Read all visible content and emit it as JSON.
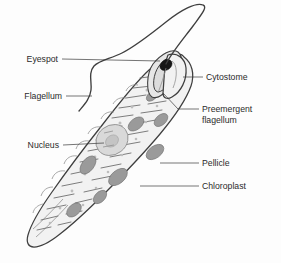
{
  "figure": {
    "background_color": "#fdfdfd",
    "outline_color": "#3f3f3f",
    "cell_fill_color": "#f2f2f2",
    "chloroplast_color": "#9a9a9a",
    "nucleus_color": "#d9d9d9",
    "eyespot_color": "#171717",
    "label_color": "#2b2b2b"
  },
  "labels": {
    "eyespot": "Eyespot",
    "flagellum": "Flagellum",
    "nucleus": "Nucleus",
    "cytostome": "Cytostome",
    "preemergent_line1": "Preemergent",
    "preemergent_line2": "flagellum",
    "pellicle": "Pellicle",
    "chloroplast": "Chloroplast"
  },
  "parts": [
    {
      "name": "eyespot",
      "label": "Eyespot",
      "side": "left"
    },
    {
      "name": "flagellum",
      "label": "Flagellum",
      "side": "left"
    },
    {
      "name": "nucleus",
      "label": "Nucleus",
      "side": "left"
    },
    {
      "name": "cytostome",
      "label": "Cytostome",
      "side": "right"
    },
    {
      "name": "preemergent-flagellum",
      "label": "Preemergent flagellum",
      "side": "right"
    },
    {
      "name": "pellicle",
      "label": "Pellicle",
      "side": "right"
    },
    {
      "name": "chloroplast",
      "label": "Chloroplast",
      "side": "right"
    }
  ]
}
